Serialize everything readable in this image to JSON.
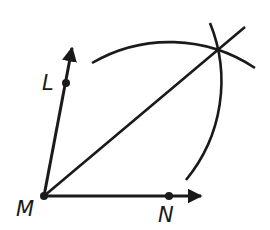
{
  "diagram": {
    "type": "angle-bisector-construction",
    "stroke_color": "#1a1a1a",
    "background": "#ffffff",
    "points": {
      "M": {
        "label": "M",
        "x": 44,
        "y": 196
      },
      "L": {
        "label": "L",
        "x": 66,
        "y": 83
      },
      "N": {
        "label": "N",
        "x": 169,
        "y": 196
      },
      "intersection": {
        "x": 219,
        "y": 50
      }
    },
    "rays": [
      {
        "name": "ray-ML",
        "from": "M",
        "to": [
          72,
          45
        ]
      },
      {
        "name": "ray-MN",
        "from": "M",
        "to": [
          204,
          196
        ]
      }
    ],
    "bisector": {
      "from": "M",
      "to": [
        245,
        27
      ]
    },
    "arcs": [
      {
        "name": "arc-centered-N",
        "center": "N",
        "radius": 154,
        "start": [
          92,
          63
        ],
        "end": [
          255,
          68
        ]
      },
      {
        "name": "arc-centered-L",
        "center": "L",
        "radius": 155,
        "start": [
          210,
          23
        ],
        "end": [
          186,
          180
        ]
      }
    ]
  },
  "labels": {
    "M": "M",
    "L": "L",
    "N": "N"
  }
}
